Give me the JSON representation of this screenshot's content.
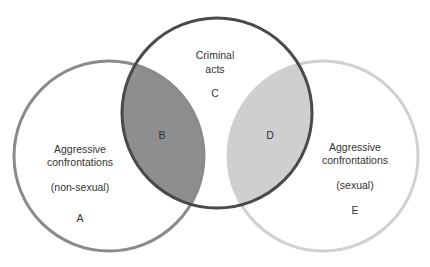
{
  "diagram": {
    "type": "venn",
    "colors": {
      "circle_left_stroke": "#8a8a8a",
      "circle_middle_stroke": "#4a4a4a",
      "circle_right_stroke": "#d0d0d0",
      "region_b_fill": "#8e8e8e",
      "region_d_fill": "#cfcfcf",
      "text": "#333333"
    },
    "circles": [
      {
        "id": "left",
        "lines": [
          "Aggressive",
          "confrontations",
          "(non-sexual)"
        ],
        "region_label": "A"
      },
      {
        "id": "middle",
        "lines": [
          "Criminal",
          "acts"
        ],
        "region_label": "C"
      },
      {
        "id": "right",
        "lines": [
          "Aggressive",
          "confrontations",
          "(sexual)"
        ],
        "region_label": "E"
      }
    ],
    "intersections": [
      {
        "id": "left-middle",
        "label": "B"
      },
      {
        "id": "middle-right",
        "label": "D"
      }
    ]
  }
}
